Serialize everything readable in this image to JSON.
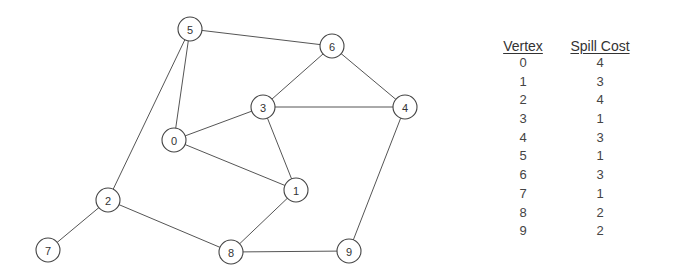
{
  "graph": {
    "nodes": [
      {
        "id": "0",
        "pos": [
          174,
          140
        ]
      },
      {
        "id": "1",
        "pos": [
          296,
          190
        ]
      },
      {
        "id": "2",
        "pos": [
          108,
          200
        ]
      },
      {
        "id": "3",
        "pos": [
          263,
          107
        ]
      },
      {
        "id": "4",
        "pos": [
          405,
          107
        ]
      },
      {
        "id": "5",
        "pos": [
          190,
          29
        ]
      },
      {
        "id": "6",
        "pos": [
          332,
          46
        ]
      },
      {
        "id": "7",
        "pos": [
          48,
          250
        ]
      },
      {
        "id": "8",
        "pos": [
          231,
          252
        ]
      },
      {
        "id": "9",
        "pos": [
          349,
          251
        ]
      }
    ],
    "edges": [
      [
        "5",
        "6"
      ],
      [
        "5",
        "0"
      ],
      [
        "5",
        "2"
      ],
      [
        "6",
        "3"
      ],
      [
        "6",
        "4"
      ],
      [
        "3",
        "4"
      ],
      [
        "3",
        "0"
      ],
      [
        "3",
        "1"
      ],
      [
        "0",
        "1"
      ],
      [
        "1",
        "8"
      ],
      [
        "2",
        "7"
      ],
      [
        "2",
        "8"
      ],
      [
        "8",
        "9"
      ],
      [
        "4",
        "9"
      ]
    ]
  },
  "table": {
    "headers": {
      "vertex": "Vertex",
      "cost": "Spill Cost"
    },
    "rows": [
      {
        "vertex": "0",
        "cost": "4"
      },
      {
        "vertex": "1",
        "cost": "3"
      },
      {
        "vertex": "2",
        "cost": "4"
      },
      {
        "vertex": "3",
        "cost": "1"
      },
      {
        "vertex": "4",
        "cost": "3"
      },
      {
        "vertex": "5",
        "cost": "1"
      },
      {
        "vertex": "6",
        "cost": "3"
      },
      {
        "vertex": "7",
        "cost": "1"
      },
      {
        "vertex": "8",
        "cost": "2"
      },
      {
        "vertex": "9",
        "cost": "2"
      }
    ]
  }
}
